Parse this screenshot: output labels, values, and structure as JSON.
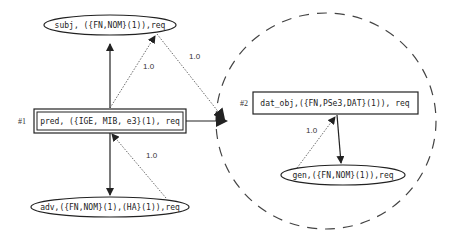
{
  "nodes": {
    "subj": {
      "label": "subj, ({FN,NOM}(1)),req"
    },
    "pred": {
      "label": "pred, ({IGE, MIB, e3}(1), req",
      "index": "#1"
    },
    "adv": {
      "label": "adv,({FN,NOM}(1),(HA}(1)),req"
    },
    "dat_obj": {
      "label": "dat_obj,({FN,PSe3,DAT}(1)), req",
      "index": "#2"
    },
    "gen": {
      "label": "gen,({FN,NOM}(1)),req"
    }
  },
  "edges": {
    "pred_subj_weight": "1.0",
    "subj_group_weight": "1.0",
    "adv_pred_weight": "1.0",
    "gen_datobj_weight": "1.0"
  },
  "colors": {
    "stroke": "#222222",
    "dashed": "#444444"
  }
}
